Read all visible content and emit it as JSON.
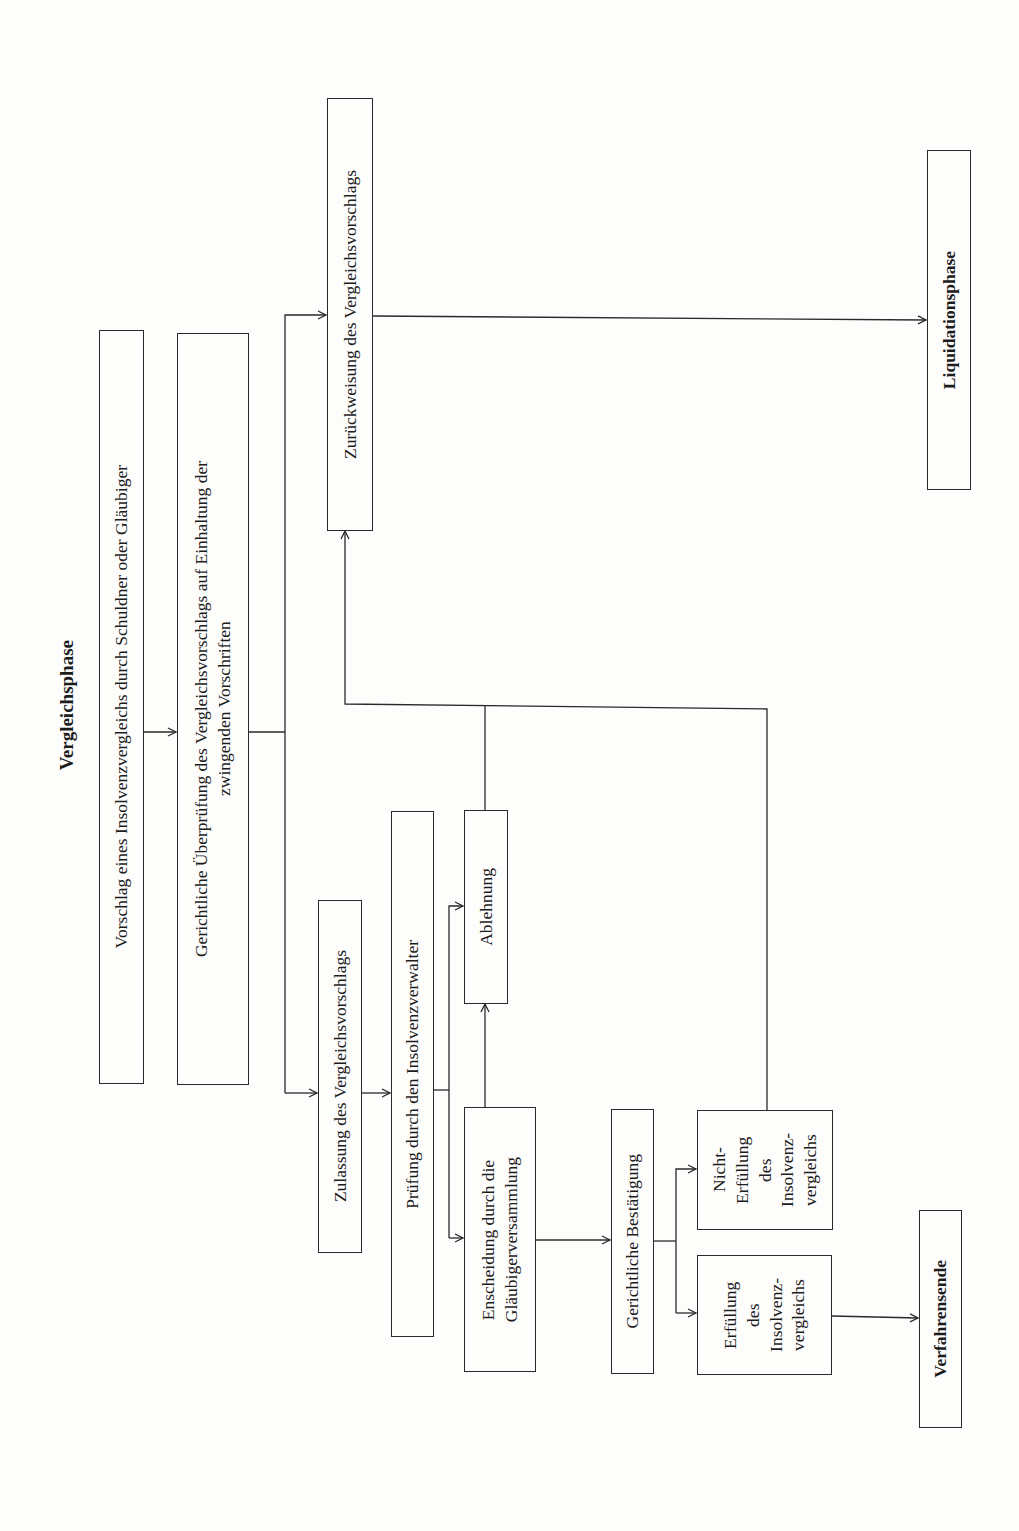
{
  "title": "Vergleichsphase",
  "colors": {
    "line": "#2a2a2a",
    "background": "#fdfdfc",
    "text": "#1c1c1c"
  },
  "nodes": {
    "vorschlag": "Vorschlag eines Insolvenzvergleichs durch Schuldner oder Gläubiger",
    "ueberpruefung": "Gerichtliche Überprüfung des Vergleichsvorschlags auf Einhaltung der\nzwingenden Vorschriften",
    "zurueckweisung": "Zurückweisung des Vergleichsvorschlags",
    "zulassung": "Zulassung des Vergleichsvorschlags",
    "pruefung": "Prüfung durch den Insolvenzverwalter",
    "ablehnung": "Ablehnung",
    "entscheidung": "Enscheidung durch die\nGläubigerversammlung",
    "bestaetigung": "Gerichtliche Bestätigung",
    "nicht_erfuellung": "Nicht-\nErfüllung\ndes\nInsolvenz-\nvergleichs",
    "erfuellung": "Erfüllung\ndes\nInsolvenz-\nvergleichs",
    "verfahrensende": "Verfahrensende",
    "liquidationsphase": "Liquidationsphase"
  },
  "edges": [
    {
      "from": "vorschlag",
      "to": "ueberpruefung"
    },
    {
      "from": "ueberpruefung",
      "to": "zurueckweisung"
    },
    {
      "from": "ueberpruefung",
      "to": "zulassung"
    },
    {
      "from": "zulassung",
      "to": "pruefung"
    },
    {
      "from": "pruefung",
      "to": "ablehnung"
    },
    {
      "from": "pruefung",
      "to": "entscheidung"
    },
    {
      "from": "entscheidung",
      "to": "ablehnung"
    },
    {
      "from": "ablehnung",
      "to": "zurueckweisung"
    },
    {
      "from": "nicht_erfuellung",
      "to": "zurueckweisung"
    },
    {
      "from": "entscheidung",
      "to": "bestaetigung"
    },
    {
      "from": "bestaetigung",
      "to": "nicht_erfuellung"
    },
    {
      "from": "bestaetigung",
      "to": "erfuellung"
    },
    {
      "from": "erfuellung",
      "to": "verfahrensende"
    },
    {
      "from": "zurueckweisung",
      "to": "liquidationsphase"
    }
  ]
}
